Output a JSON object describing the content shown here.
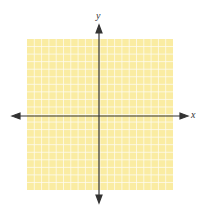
{
  "diagram": {
    "type": "coordinate-plane",
    "x_axis_label": "x",
    "y_axis_label": "y",
    "grid": {
      "columns": 20,
      "rows": 20,
      "fill_color": "#faeca2",
      "line_color": "#ffffff"
    },
    "axis_color": "#333333"
  }
}
